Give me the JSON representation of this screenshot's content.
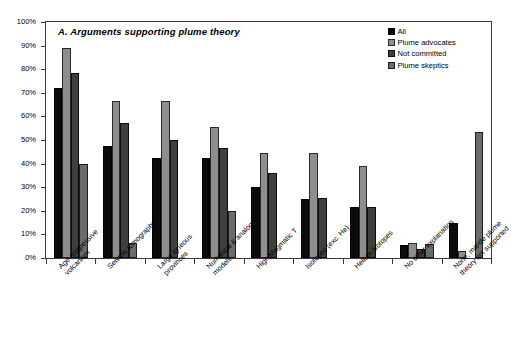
{
  "chart_data": {
    "type": "bar",
    "title": "A. Arguments supporting plume theory",
    "xlabel": "",
    "ylabel": "",
    "ylim": [
      0,
      100
    ],
    "yticks": [
      "0%",
      "10%",
      "20%",
      "30%",
      "40%",
      "50%",
      "60%",
      "70%",
      "80%",
      "90%",
      "100%"
    ],
    "grid": false,
    "legend_position": "top-right-inside",
    "categories": [
      "Age-progressive volcanism",
      "Seismic tomography",
      "Large igneous provinces",
      "Numerical & analog models",
      "High Magmatic T",
      "Isotopes (exc. He)",
      "Helium isotopes",
      "No other explanation",
      "None, mantle plume theory not supported"
    ],
    "category_lines": [
      [
        "Age-progressive",
        "volcanism"
      ],
      [
        "Seismic tomography"
      ],
      [
        "Large igneous",
        "provinces"
      ],
      [
        "Numerical & analog",
        "models"
      ],
      [
        "High Magmatic T"
      ],
      [
        "Isotopes (exc. He)"
      ],
      [
        "Helium isotopes"
      ],
      [
        "No other explanation"
      ],
      [
        "None, mantle plume",
        "theory not supported"
      ]
    ],
    "series": [
      {
        "name": "All",
        "color": "#0b0b0b",
        "values": [
          72,
          47.5,
          42.5,
          42.5,
          30,
          25,
          21.5,
          5.5,
          15
        ]
      },
      {
        "name": "Plume advocates",
        "color": "#8e8e8e",
        "values": [
          89,
          66.5,
          66.5,
          55.5,
          44.5,
          44.5,
          39,
          6.5,
          3
        ]
      },
      {
        "name": "Not committed",
        "color": "#3f3f3f",
        "values": [
          78.5,
          57,
          50,
          46.5,
          36,
          25.5,
          21.5,
          4,
          0
        ]
      },
      {
        "name": "Plume skeptics",
        "color": "#6b6b6b",
        "values": [
          40,
          6.5,
          0,
          20,
          0,
          0,
          0,
          6,
          53.5
        ]
      }
    ]
  }
}
